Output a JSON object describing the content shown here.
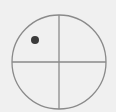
{
  "diagram": {
    "type": "circle-quadrant-crosshair",
    "background": "#f0f0f0",
    "stroke_color": "#8a8a8a",
    "dot_color": "#3a3a3a",
    "circle": {
      "cx": 59,
      "cy": 62,
      "r": 47
    },
    "dot": {
      "cx": 35,
      "cy": 40,
      "r": 4,
      "quadrant": "upper-left"
    }
  }
}
